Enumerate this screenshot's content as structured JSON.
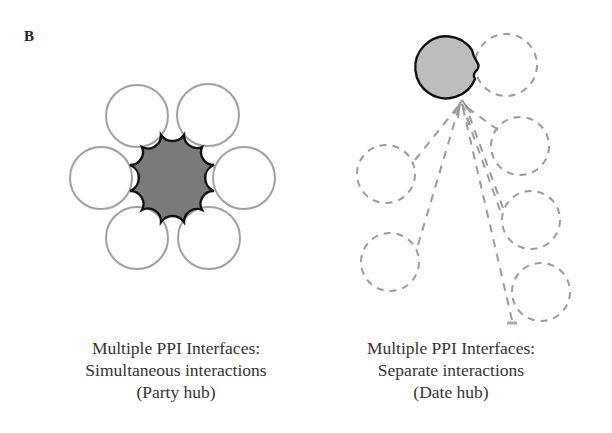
{
  "panel": {
    "label": "B"
  },
  "left_diagram": {
    "hub_fill": "#7a7a7a",
    "partner_stroke": "#a0a0a0",
    "partner_count": 6,
    "caption": {
      "line1": "Multiple PPI Interfaces:",
      "line2": "Simultaneous interactions",
      "line3": "(Party hub)"
    }
  },
  "right_diagram": {
    "hub_fill": "#bdbdbd",
    "partner_stroke": "#9a9a9a",
    "partner_count": 7,
    "caption": {
      "line1": "Multiple PPI Interfaces:",
      "line2": "Separate interactions",
      "line3": "(Date hub)"
    }
  }
}
